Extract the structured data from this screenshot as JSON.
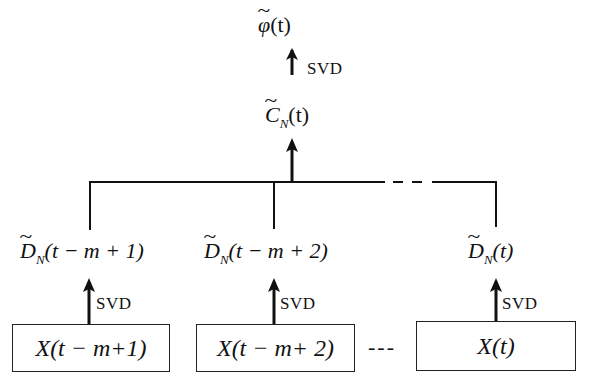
{
  "diagram": {
    "top": {
      "output_label": "φ(t)",
      "output_symbol": "φ",
      "output_arg": "(t)",
      "arrow_label": "SVD",
      "combined_label": "C_N(t)",
      "combined_symbol": "C",
      "combined_sub": "N",
      "combined_arg": "(t)"
    },
    "branches": [
      {
        "d_label": "D_N(t − m + 1)",
        "d_symbol": "D",
        "d_sub": "N",
        "d_arg": "(t − m + 1)",
        "arrow_label": "SVD",
        "box_label": "X(t − m+1)"
      },
      {
        "d_label": "D_N(t − m + 2)",
        "d_symbol": "D",
        "d_sub": "N",
        "d_arg": "(t − m + 2)",
        "arrow_label": "SVD",
        "box_label": "X(t − m+ 2)"
      },
      {
        "d_label": "D_N(t)",
        "d_symbol": "D",
        "d_sub": "N",
        "d_arg": "(t)",
        "arrow_label": "SVD",
        "box_label": "X(t)"
      }
    ],
    "ellipsis_boxes": "---",
    "ellipsis_bus": "- - -"
  }
}
